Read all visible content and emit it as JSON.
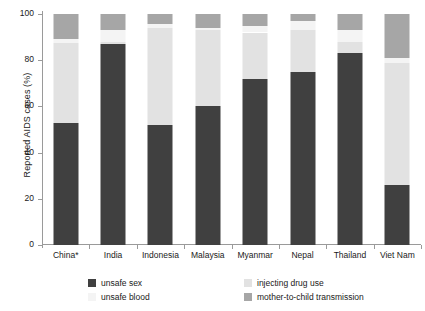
{
  "chart_data": {
    "type": "bar",
    "subtype": "stacked-bar-100pct",
    "title": "",
    "xlabel": "",
    "ylabel": "Reported AIDS cases (%)",
    "ylim": [
      0,
      100
    ],
    "yticks": [
      0,
      20,
      40,
      60,
      80,
      100
    ],
    "ytick_labels": [
      "0",
      "20",
      "40",
      "60",
      "80",
      "100"
    ],
    "grid": false,
    "legend_position": "bottom",
    "categories": [
      "China*",
      "India",
      "Indonesia",
      "Malaysia",
      "Myanmar",
      "Nepal",
      "Thailand",
      "Viet Nam"
    ],
    "series": [
      {
        "name": "unsafe sex",
        "color": "#404040",
        "values": [
          53,
          87,
          52,
          60,
          72,
          75,
          83,
          26
        ]
      },
      {
        "name": "injecting drug use",
        "color": "#e2e2e2",
        "values": [
          34.5,
          1,
          42,
          33,
          20,
          18,
          5,
          53
        ]
      },
      {
        "name": "unsafe blood",
        "color": "#f4f4f4",
        "values": [
          1.5,
          5,
          1.5,
          1,
          3,
          4,
          5,
          2
        ]
      },
      {
        "name": "mother-to-child transmission",
        "color": "#a6a6a6",
        "values": [
          11,
          7,
          4.5,
          6,
          5,
          3,
          7,
          19
        ]
      }
    ],
    "stack_order_bottom_to_top": [
      "unsafe sex",
      "injecting drug use",
      "unsafe blood",
      "mother-to-child transmission"
    ],
    "annotations": [
      "* China bar label carries an asterisk footnote marker"
    ]
  },
  "legend": {
    "items": [
      {
        "label": "unsafe sex",
        "color": "#404040"
      },
      {
        "label": "injecting drug use",
        "color": "#e2e2e2"
      },
      {
        "label": "unsafe blood",
        "color": "#f4f4f4"
      },
      {
        "label": "mother-to-child transmission",
        "color": "#a6a6a6"
      }
    ]
  }
}
